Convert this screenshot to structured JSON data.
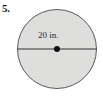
{
  "figure": {
    "problem_number": "5.",
    "width": 103,
    "height": 99,
    "background_color": "#ffffff"
  },
  "shape": {
    "name": "circle",
    "fill_color": "#dededd",
    "stroke_color": "#5a5a5a",
    "stroke_width": 1,
    "center_x": 57,
    "center_y": 49,
    "radius": 40,
    "center_dot": {
      "name": "center-point",
      "radius": 3,
      "color": "#111111"
    },
    "diameter_line": {
      "name": "diameter-segment",
      "x1": 17,
      "y1": 49,
      "x2": 97,
      "y2": 49,
      "color": "#333333"
    }
  },
  "labels": {
    "diameter": "20 in."
  }
}
